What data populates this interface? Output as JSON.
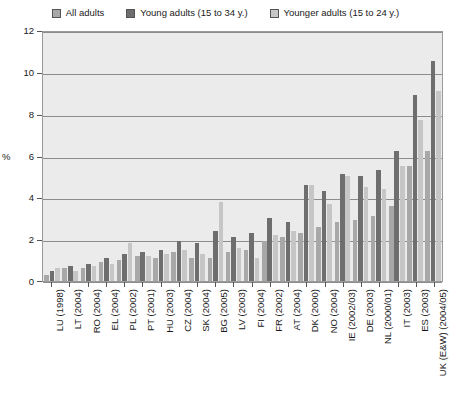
{
  "chart_data": {
    "type": "bar",
    "title": "",
    "xlabel": "",
    "ylabel": "%",
    "ylim": [
      0,
      12
    ],
    "yticks": [
      0,
      2,
      4,
      6,
      8,
      10,
      12
    ],
    "grid": true,
    "legend_position": "top",
    "categories": [
      "LU (1998)",
      "LT (2004)",
      "RO (2004)",
      "EL (2004)",
      "PL (2002)",
      "PT (2001)",
      "HU (2003)",
      "CZ (2004)",
      "SK (2004)",
      "BG (2005)",
      "LV (2003)",
      "FI (2004)",
      "FR (2002)",
      "AT (2004)",
      "DK (2000)",
      "NO (2004)",
      "IE (2002/03)",
      "DE (2003)",
      "NL (2000/01)",
      "IT (2003)",
      "ES (2003)",
      "UK (E&W) (2004/05)"
    ],
    "series": [
      {
        "name": "All adults",
        "color": "#a8a8a8",
        "values": [
          0.3,
          0.6,
          0.6,
          0.9,
          1.0,
          1.2,
          1.1,
          1.4,
          1.1,
          1.1,
          1.4,
          1.5,
          1.9,
          2.1,
          2.3,
          2.6,
          2.8,
          2.9,
          3.1,
          3.6,
          5.5,
          6.2
        ]
      },
      {
        "name": "Young adults (15 to 34 y.)",
        "color": "#6e6e6e",
        "values": [
          0.5,
          0.7,
          0.8,
          1.1,
          1.3,
          1.4,
          1.5,
          1.9,
          1.8,
          2.4,
          2.1,
          2.3,
          3.0,
          2.8,
          4.6,
          4.3,
          5.1,
          5.0,
          5.3,
          6.2,
          8.9,
          10.5
        ]
      },
      {
        "name": "Younger adults (15 to 24 y.)",
        "color": "#c6c6c6",
        "values": [
          0.6,
          0.5,
          0.7,
          0.8,
          1.8,
          1.2,
          1.3,
          1.5,
          1.3,
          3.8,
          1.6,
          1.1,
          2.2,
          2.4,
          4.6,
          3.7,
          5.0,
          4.5,
          4.4,
          5.5,
          7.7,
          9.1
        ]
      }
    ]
  }
}
